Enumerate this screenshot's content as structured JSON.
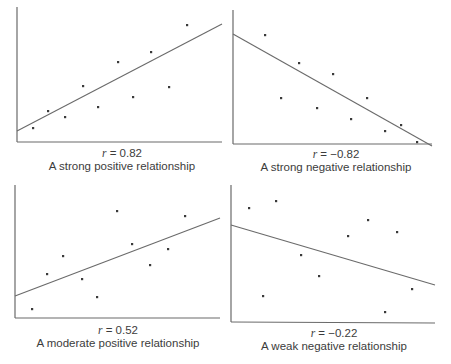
{
  "chart_data": [
    {
      "type": "scatter",
      "title": "",
      "r_label": "r",
      "r_value": "= 0.82",
      "caption": "A strong positive relationship",
      "xlabel": "",
      "ylabel": "",
      "grid": false,
      "panel": {
        "axis_origin": [
          17,
          142
        ],
        "y_top": 7,
        "x_right": 222
      },
      "points": [
        [
          33,
          128
        ],
        [
          48,
          111
        ],
        [
          65,
          117
        ],
        [
          83,
          86
        ],
        [
          98,
          107
        ],
        [
          118,
          62
        ],
        [
          133,
          97
        ],
        [
          151,
          52
        ],
        [
          169,
          87
        ],
        [
          187,
          25
        ]
      ],
      "fit_line": [
        [
          17,
          131
        ],
        [
          222,
          24
        ]
      ],
      "caption_pos": {
        "x": 22,
        "y": 147,
        "w": 200
      }
    },
    {
      "type": "scatter",
      "title": "",
      "r_label": "r",
      "r_value": "= −0.82",
      "caption": "A strong negative relationship",
      "xlabel": "",
      "ylabel": "",
      "grid": false,
      "panel": {
        "axis_origin": [
          233,
          144
        ],
        "y_top": 10,
        "x_right": 432
      },
      "points": [
        [
          265,
          35
        ],
        [
          281,
          98
        ],
        [
          299,
          63
        ],
        [
          317,
          108
        ],
        [
          333,
          74
        ],
        [
          351,
          119
        ],
        [
          367,
          98
        ],
        [
          385,
          131
        ],
        [
          401,
          125
        ],
        [
          417,
          142
        ]
      ],
      "fit_line": [
        [
          233,
          34
        ],
        [
          432,
          146
        ]
      ],
      "caption_pos": {
        "x": 236,
        "y": 148,
        "w": 200
      }
    },
    {
      "type": "scatter",
      "title": "",
      "r_label": "r",
      "r_value": "= 0.52",
      "caption": "A moderate positive relationship",
      "xlabel": "",
      "ylabel": "",
      "grid": false,
      "panel": {
        "axis_origin": [
          15,
          318
        ],
        "y_top": 185,
        "x_right": 220
      },
      "points": [
        [
          32,
          309
        ],
        [
          47,
          274
        ],
        [
          63,
          256
        ],
        [
          82,
          279
        ],
        [
          97,
          297
        ],
        [
          117,
          211
        ],
        [
          132,
          244
        ],
        [
          150,
          265
        ],
        [
          168,
          249
        ],
        [
          185,
          216
        ]
      ],
      "fit_line": [
        [
          15,
          296
        ],
        [
          220,
          218
        ]
      ],
      "caption_pos": {
        "x": 18,
        "y": 324,
        "w": 200
      }
    },
    {
      "type": "scatter",
      "title": "",
      "r_label": "r",
      "r_value": "= −0.22",
      "caption": "A weak negative relationship",
      "xlabel": "",
      "ylabel": "",
      "grid": false,
      "panel": {
        "axis_origin": [
          231,
          322
        ],
        "y_top": 185,
        "x_right": 435
      },
      "points": [
        [
          249,
          208
        ],
        [
          276,
          201
        ],
        [
          263,
          296
        ],
        [
          301,
          255
        ],
        [
          319,
          276
        ],
        [
          348,
          236
        ],
        [
          368,
          220
        ],
        [
          385,
          312
        ],
        [
          397,
          232
        ],
        [
          412,
          289
        ]
      ],
      "fit_line": [
        [
          231,
          225
        ],
        [
          435,
          285
        ]
      ],
      "caption_pos": {
        "x": 234,
        "y": 327,
        "w": 200
      }
    }
  ],
  "style": {
    "axis_color": "#6a6a6a",
    "line_color": "#6a6a6a",
    "point_color": "#3a3a3a"
  }
}
